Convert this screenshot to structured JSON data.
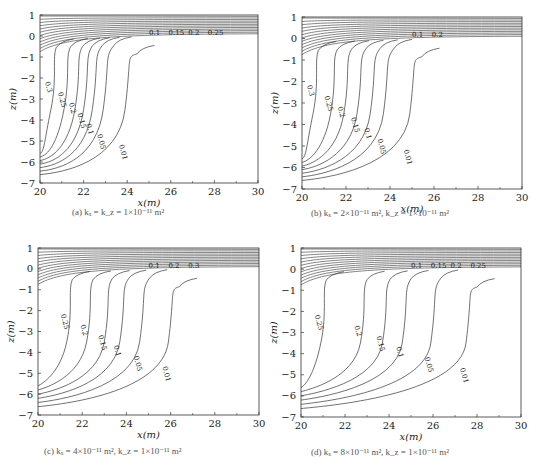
{
  "chart_data": [
    {
      "type": "contour",
      "id": "a",
      "caption": "(a) k_x = k_z = 1×10⁻¹¹ m²",
      "xlabel": "x(m)",
      "ylabel": "z(m)",
      "xlim": [
        20,
        30
      ],
      "ylim": [
        -7,
        1
      ],
      "xticks": [
        20,
        22,
        24,
        26,
        28,
        30
      ],
      "yticks": [
        1,
        0,
        -1,
        -2,
        -3,
        -4,
        -5,
        -6,
        -7
      ],
      "levels": [
        0.01,
        0.05,
        0.1,
        0.15,
        0.2,
        0.25,
        0.3
      ],
      "surface_labels": [
        "0.1",
        "0.15",
        "0.2",
        "0.25"
      ],
      "plume_front_x": {
        "0.3": 20.5,
        "0.25": 21.1,
        "0.2": 21.6,
        "0.15": 22.0,
        "0.1": 22.4,
        "0.05": 22.9,
        "0.01": 23.9
      },
      "plume_bottom_z": -6.6
    },
    {
      "type": "contour",
      "id": "b",
      "caption": "(b) k_x = 2×10⁻¹¹ m², k_z = 1×10⁻¹¹ m²",
      "xlabel": "x(m)",
      "ylabel": "z(m)",
      "xlim": [
        20,
        30
      ],
      "ylim": [
        -7,
        1
      ],
      "xticks": [
        20,
        22,
        24,
        26,
        28,
        30
      ],
      "yticks": [
        1,
        0,
        -1,
        -2,
        -3,
        -4,
        -5,
        -6,
        -7
      ],
      "levels": [
        0.01,
        0.05,
        0.1,
        0.15,
        0.2,
        0.25,
        0.3
      ],
      "surface_labels": [
        "0.1",
        "0.2"
      ],
      "plume_front_x": {
        "0.3": 20.5,
        "0.25": 21.3,
        "0.2": 21.9,
        "0.15": 22.5,
        "0.1": 23.1,
        "0.05": 23.7,
        "0.01": 24.9
      },
      "plume_bottom_z": -6.6
    },
    {
      "type": "contour",
      "id": "c",
      "caption": "(c) k_x = 4×10⁻¹¹ m², k_z = 1×10⁻¹¹ m²",
      "xlabel": "x(m)",
      "ylabel": "z(m)",
      "xlim": [
        20,
        30
      ],
      "ylim": [
        -7,
        1
      ],
      "xticks": [
        20,
        22,
        24,
        26,
        28,
        30
      ],
      "yticks": [
        1,
        0,
        -1,
        -2,
        -3,
        -4,
        -5,
        -6,
        -7
      ],
      "levels": [
        0.01,
        0.05,
        0.1,
        0.15,
        0.2,
        0.25
      ],
      "surface_labels": [
        "0.1",
        "0.2",
        "0.3"
      ],
      "plume_front_x": {
        "0.25": 21.3,
        "0.2": 22.2,
        "0.15": 23.0,
        "0.1": 23.7,
        "0.05": 24.6,
        "0.01": 25.9
      },
      "plume_bottom_z": -6.6
    },
    {
      "type": "contour",
      "id": "d",
      "caption": "(d) k_x = 8×10⁻¹¹ m², k_z = 1×10⁻¹¹ m²",
      "xlabel": "x(m)",
      "ylabel": "z(m)",
      "xlim": [
        20,
        30
      ],
      "ylim": [
        -7,
        1
      ],
      "xticks": [
        20,
        22,
        24,
        26,
        28,
        30
      ],
      "yticks": [
        1,
        0,
        -1,
        -2,
        -3,
        -4,
        -5,
        -6,
        -7
      ],
      "levels": [
        0.01,
        0.05,
        0.1,
        0.15,
        0.2,
        0.25
      ],
      "surface_labels": [
        "0.1",
        "0.15",
        "0.2",
        "0.25"
      ],
      "plume_front_x": {
        "0.25": 20.9,
        "0.2": 22.7,
        "0.15": 23.7,
        "0.1": 24.6,
        "0.05": 25.9,
        "0.01": 27.5
      },
      "plume_bottom_z": -6.6
    }
  ],
  "panels": [
    {
      "letter": "(a)",
      "caption_main": "k",
      "caption_text": "(a) kₓ = k_z = 1×10⁻¹¹ m²"
    },
    {
      "letter": "(b)",
      "caption_text": "(b) kₓ = 2×10⁻¹¹ m², k_z = 1×10⁻¹¹ m²"
    },
    {
      "letter": "(c)",
      "caption_text": "(c) kₓ = 4×10⁻¹¹ m², k_z = 1×10⁻¹¹ m²"
    },
    {
      "letter": "(d)",
      "caption_text": "(d) kₓ = 8×10⁻¹¹ m², k_z = 1×10⁻¹¹ m²"
    }
  ],
  "axis": {
    "xlabel": "x(m)",
    "ylabel": "z(m)"
  }
}
